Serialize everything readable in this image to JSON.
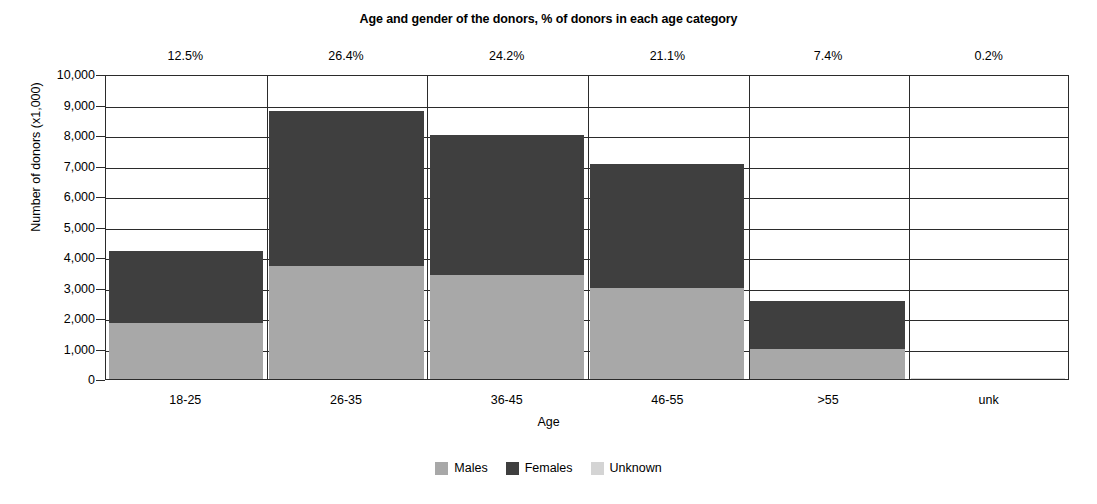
{
  "chart_data": {
    "type": "bar",
    "subtype": "stacked-vertical",
    "title": "Age and gender of the donors, % of donors in each age category",
    "xlabel": "Age",
    "ylabel": "Number of donors (x1,000)",
    "categories": [
      "18-25",
      "26-35",
      "36-45",
      "46-55",
      ">55",
      "unk"
    ],
    "series": [
      {
        "name": "Males",
        "color": "#a8a8a8",
        "values": [
          1850,
          3700,
          3400,
          3000,
          1000,
          0
        ]
      },
      {
        "name": "Females",
        "color": "#3f3f3f",
        "values": [
          2350,
          5100,
          4600,
          4050,
          1550,
          0
        ]
      },
      {
        "name": "Unknown",
        "color": "#d4d4d4",
        "values": [
          0,
          0,
          0,
          0,
          0,
          20
        ]
      }
    ],
    "totals": [
      4200,
      8800,
      8000,
      7050,
      2550,
      20
    ],
    "category_percent_labels": [
      "12.5%",
      "26.4%",
      "24.2%",
      "21.1%",
      "7.4%",
      "0.2%"
    ],
    "ylim": [
      0,
      10000
    ],
    "ytick_values": [
      0,
      1000,
      2000,
      3000,
      4000,
      5000,
      6000,
      7000,
      8000,
      9000,
      10000
    ],
    "ytick_labels": [
      "0",
      "1,000",
      "2,000",
      "3,000",
      "4,000",
      "5,000",
      "6,000",
      "7,000",
      "8,000",
      "9,000",
      "10,000"
    ],
    "grid": "horizontal-and-category-dividers",
    "legend_position": "bottom-center",
    "legend": [
      {
        "label": "Males",
        "color": "#a8a8a8"
      },
      {
        "label": "Females",
        "color": "#3f3f3f"
      },
      {
        "label": "Unknown",
        "color": "#d4d4d4"
      }
    ]
  }
}
